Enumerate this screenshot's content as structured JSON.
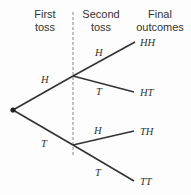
{
  "headers": {
    "first": [
      "First",
      "toss"
    ],
    "second": [
      "Second",
      "toss"
    ],
    "final": [
      "Final",
      "outcomes"
    ]
  },
  "tree": {
    "root": {
      "x": 13,
      "y": 110
    },
    "first_toss": [
      {
        "label": "H",
        "node": {
          "x": 73,
          "y": 76
        }
      },
      {
        "label": "T",
        "node": {
          "x": 73,
          "y": 145
        }
      }
    ],
    "second_toss": [
      {
        "from": "H",
        "label": "H",
        "outcome": "HH"
      },
      {
        "from": "H",
        "label": "T",
        "outcome": "HT"
      },
      {
        "from": "T",
        "label": "H",
        "outcome": "TH"
      },
      {
        "from": "T",
        "label": "T",
        "outcome": "TT"
      }
    ]
  },
  "colors": {
    "line": "#333333",
    "dashed": "#888888",
    "text": "#333333"
  }
}
